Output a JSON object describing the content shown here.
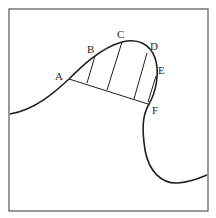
{
  "diagram": {
    "colors": {
      "stroke": "#1f1f1f",
      "frame": "#555555",
      "background": "#ffffff"
    },
    "labels": {
      "A": "A",
      "B": "B",
      "C": "C",
      "D": "D",
      "E": "E",
      "F": "F"
    },
    "points": {
      "A": [
        69,
        79
      ],
      "B": [
        95,
        56
      ],
      "C": [
        122,
        42
      ],
      "D": [
        147,
        52
      ],
      "E": [
        156,
        76
      ],
      "F": [
        148,
        104
      ]
    }
  }
}
